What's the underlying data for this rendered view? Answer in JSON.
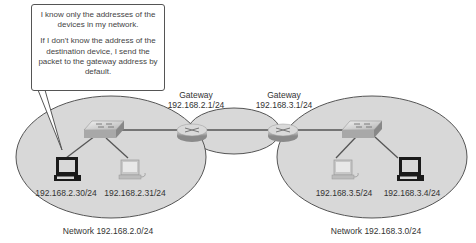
{
  "callout": {
    "line1": "I know only the addresses of the devices in my network.",
    "line2": "If I don't know the address of the destination device, I send the packet to the gateway address by default."
  },
  "gateways": [
    {
      "title": "Gateway",
      "address": "192.168.2.1/24"
    },
    {
      "title": "Gateway",
      "address": "192.168.3.1/24"
    }
  ],
  "networks": [
    {
      "label": "Network 192.168.2.0/24",
      "hosts": [
        {
          "address": "192.168.2.30/24",
          "highlighted": true
        },
        {
          "address": "192.168.2.31/24",
          "highlighted": false
        }
      ]
    },
    {
      "label": "Network 192.168.3.0/24",
      "hosts": [
        {
          "address": "192.168.3.5/24",
          "highlighted": false
        },
        {
          "address": "192.168.3.4/24",
          "highlighted": true
        }
      ]
    }
  ],
  "colors": {
    "network_fill": "#d8d8d8",
    "network_stroke": "#555555",
    "link": "#555555",
    "device": "#9a9a9a"
  }
}
